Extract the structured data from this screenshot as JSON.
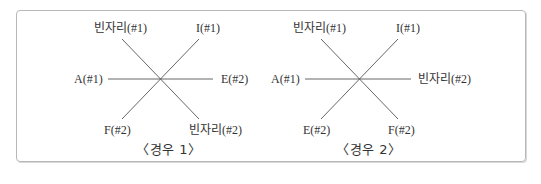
{
  "diagrams": [
    {
      "labels": {
        "top_left": "빈자리(#1)",
        "top_right": "I(#1)",
        "left": "A(#1)",
        "right": "E(#2)",
        "bottom_left": "F(#2)",
        "bottom_right": "빈자리(#2)"
      },
      "caption": "〈경우 1〉"
    },
    {
      "labels": {
        "top_left": "빈자리(#1)",
        "top_right": "I(#1)",
        "left": "A(#1)",
        "right": "빈자리(#2)",
        "bottom_left": "E(#2)",
        "bottom_right": "F(#2)"
      },
      "caption": "〈경우 2〉"
    }
  ],
  "colors": {
    "line": "#555555",
    "border": "#b8b8b8",
    "text": "#333333"
  }
}
